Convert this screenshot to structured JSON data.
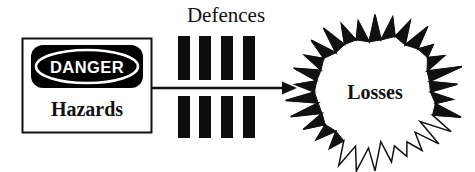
{
  "diagram": {
    "hazard_box": {
      "sign_label": "DANGER",
      "caption": "Hazards",
      "sign_fill": "#000000",
      "sign_text_color": "#ffffff",
      "border_color": "#111111",
      "box_fill": "#ffffff"
    },
    "defences": {
      "label": "Defences",
      "bar_count": 4,
      "bar_color": "#0d0d0d",
      "bars": [
        {
          "x": 178,
          "top_y": 36,
          "top_h": 44,
          "bottom_y": 96,
          "bottom_h": 42,
          "w": 12
        },
        {
          "x": 199,
          "top_y": 36,
          "top_h": 44,
          "bottom_y": 96,
          "bottom_h": 42,
          "w": 12
        },
        {
          "x": 221,
          "top_y": 36,
          "top_h": 44,
          "bottom_y": 96,
          "bottom_h": 42,
          "w": 12
        },
        {
          "x": 243,
          "top_y": 36,
          "top_h": 44,
          "bottom_y": 96,
          "bottom_h": 42,
          "w": 12
        }
      ]
    },
    "arrow": {
      "color": "#111111",
      "x_start": 152,
      "x_end": 296,
      "y": 88
    },
    "losses": {
      "label": "Losses",
      "shape": "starburst",
      "spike_count": 30,
      "center_x": 375,
      "center_y": 92,
      "outer_radius": 88,
      "inner_radius": 60,
      "fill": "#ffffff",
      "stroke": "#111111"
    }
  }
}
